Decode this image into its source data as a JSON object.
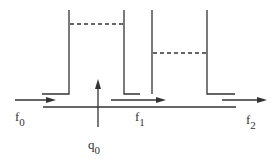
{
  "diagram": {
    "type": "two-tank flow system",
    "labels": {
      "f0": {
        "base": "f",
        "sub": "0"
      },
      "f1": {
        "base": "f",
        "sub": "1"
      },
      "f2": {
        "base": "f",
        "sub": "2"
      },
      "q0": {
        "base": "q",
        "sub": "0"
      }
    },
    "colors": {
      "stroke": "#333333",
      "background": "#ffffff"
    }
  }
}
